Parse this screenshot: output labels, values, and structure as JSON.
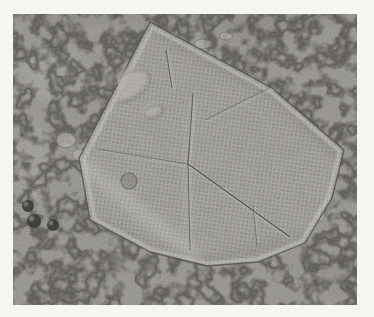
{
  "colors": {
    "paper": "#f6f5f1",
    "photo_bg": "#a9a7a2",
    "crystal_fill": "#b2b0ab",
    "vein": "#4f4e49",
    "grain_dark": "#34332f",
    "grain_light": "#f5f4f0",
    "ridge_light": "#dcdbd6",
    "ridge_dark": "#52514c",
    "shade": "#807e79",
    "highlight": "#c9c7c2",
    "blob_dark": "#403f3a",
    "dot_dark": "#5c5b56",
    "dot_light": "#d8d7d2"
  },
  "photo": {
    "frame": {
      "left": 13,
      "top": 14,
      "width": 344,
      "height": 291
    }
  },
  "crystal": {
    "outline": [
      [
        137,
        8
      ],
      [
        259,
        74
      ],
      [
        331,
        136
      ],
      [
        319,
        184
      ],
      [
        292,
        229
      ],
      [
        245,
        248
      ],
      [
        194,
        252
      ],
      [
        137,
        238
      ],
      [
        77,
        206
      ],
      [
        66,
        144
      ]
    ],
    "ridges": [
      {
        "name": "upper-vertical-ridge",
        "x1": 180,
        "y1": 80,
        "x2": 175,
        "y2": 150,
        "strength": 0.8
      },
      {
        "name": "left-ridge",
        "x1": 84,
        "y1": 135,
        "x2": 175,
        "y2": 150,
        "strength": 0.5
      },
      {
        "name": "diagonal-ridge-lower-right",
        "x1": 175,
        "y1": 150,
        "x2": 277,
        "y2": 223,
        "strength": 0.95
      },
      {
        "name": "lower-vertical-ridge",
        "x1": 175,
        "y1": 150,
        "x2": 177,
        "y2": 236,
        "strength": 0.6
      },
      {
        "name": "upper-right-ridge",
        "x1": 192,
        "y1": 106,
        "x2": 282,
        "y2": 61,
        "strength": 0.4
      },
      {
        "name": "top-crack",
        "x1": 153,
        "y1": 36,
        "x2": 159,
        "y2": 74,
        "strength": 0.75
      },
      {
        "name": "lower-right-crack",
        "x1": 240,
        "y1": 191,
        "x2": 244,
        "y2": 233,
        "strength": 0.45
      }
    ],
    "shading": [
      {
        "name": "inner-top-right-shadow",
        "pts": [
          [
            137,
            14
          ],
          [
            259,
            80
          ],
          [
            328,
            142
          ]
        ],
        "tone": "dark",
        "w": 10,
        "o": 0.3
      },
      {
        "name": "inner-bottom-shadow",
        "pts": [
          [
            80,
            204
          ],
          [
            140,
            234
          ],
          [
            196,
            247
          ],
          [
            288,
            224
          ]
        ],
        "tone": "dark",
        "w": 8,
        "o": 0.28
      },
      {
        "name": "inner-left-highlight",
        "pts": [
          [
            70,
            150
          ],
          [
            130,
            200
          ],
          [
            180,
            240
          ]
        ],
        "tone": "light",
        "w": 16,
        "o": 0.22
      },
      {
        "name": "center-highlight",
        "pts": [
          [
            180,
            85
          ],
          [
            172,
            148
          ],
          [
            176,
            230
          ]
        ],
        "tone": "light",
        "w": 6,
        "o": 0.18
      }
    ],
    "spots": [
      {
        "name": "inner-ring-spot",
        "cx": 116,
        "cy": 167,
        "rx": 8,
        "ry": 8,
        "rot": 0,
        "kind": "ring"
      },
      {
        "name": "raised-mound",
        "cx": 112,
        "cy": 71,
        "rx": 24,
        "ry": 13,
        "rot": -28,
        "kind": "mound"
      },
      {
        "name": "raised-mound-small",
        "cx": 138,
        "cy": 96,
        "rx": 10,
        "ry": 6,
        "rot": -20,
        "kind": "mound"
      }
    ]
  },
  "background": {
    "debris": [
      {
        "cx": 15,
        "cy": 192,
        "r": 6
      },
      {
        "cx": 21,
        "cy": 207,
        "r": 7
      },
      {
        "cx": 40,
        "cy": 211,
        "r": 6
      }
    ],
    "edge_bumps": [
      {
        "cx": 53,
        "cy": 126,
        "rx": 10,
        "ry": 8
      },
      {
        "cx": 67,
        "cy": 141,
        "rx": 8,
        "ry": 6
      },
      {
        "cx": 309,
        "cy": 156,
        "rx": 7,
        "ry": 7
      },
      {
        "cx": 317,
        "cy": 176,
        "rx": 6,
        "ry": 6
      },
      {
        "cx": 305,
        "cy": 201,
        "rx": 7,
        "ry": 7
      },
      {
        "cx": 287,
        "cy": 221,
        "rx": 8,
        "ry": 7
      },
      {
        "cx": 287,
        "cy": 106,
        "rx": 6,
        "ry": 6
      },
      {
        "cx": 302,
        "cy": 126,
        "rx": 6,
        "ry": 6
      },
      {
        "cx": 190,
        "cy": 30,
        "rx": 9,
        "ry": 5
      },
      {
        "cx": 213,
        "cy": 22,
        "rx": 7,
        "ry": 4
      }
    ],
    "blotches": [
      {
        "cx": 172,
        "cy": 3,
        "rx": 180,
        "ry": 7,
        "tone": "dark",
        "o": 0.2
      },
      {
        "cx": 40,
        "cy": 60,
        "rx": 32,
        "ry": 26,
        "tone": "light",
        "o": 0.15
      },
      {
        "cx": 250,
        "cy": 16,
        "rx": 45,
        "ry": 14,
        "tone": "dark",
        "o": 0.12
      },
      {
        "cx": 320,
        "cy": 262,
        "rx": 38,
        "ry": 20,
        "tone": "dark",
        "o": 0.1
      },
      {
        "cx": 18,
        "cy": 150,
        "rx": 18,
        "ry": 40,
        "tone": "light",
        "o": 0.12
      }
    ]
  }
}
